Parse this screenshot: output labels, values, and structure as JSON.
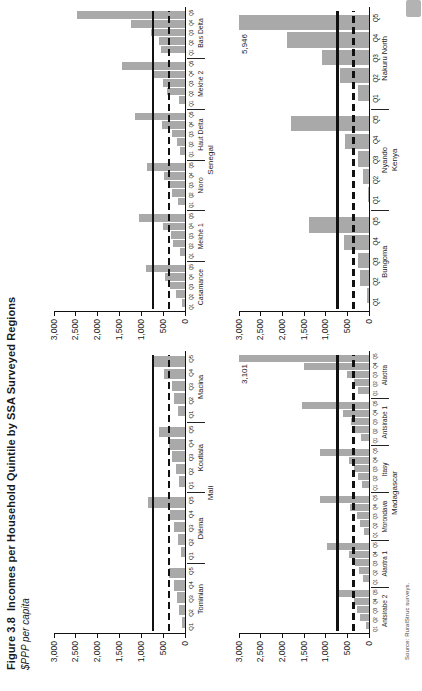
{
  "figure": {
    "label": "Figure 3.8",
    "title": "Incomes per Household Quintile by SSA Surveyed Regions",
    "subtitle": "$PPP per capita",
    "source": "Source: RuralStruc surveys.",
    "colors": {
      "bar": "#a9a9a9",
      "line": "#111111",
      "text": "#1a1a1a",
      "page_tab": "#b3b3b3"
    }
  },
  "chart_data": [
    {
      "type": "bar",
      "country": "Mali",
      "grid_position": "top-left",
      "ylim": [
        0,
        3000
      ],
      "yticks": [
        "0",
        "500",
        "1,000",
        "1,500",
        "2,000",
        "2,500",
        "3,000"
      ],
      "grid": false,
      "quintile_labels": [
        "Q1",
        "Q2",
        "Q3",
        "Q4",
        "Q5"
      ],
      "reference_lines": {
        "solid": 730,
        "dashed": 365
      },
      "groups": [
        {
          "region": "Tominian",
          "values": [
            60,
            130,
            190,
            245,
            370
          ]
        },
        {
          "region": "Diéma",
          "values": [
            90,
            170,
            260,
            340,
            850
          ]
        },
        {
          "region": "Koutiala",
          "values": [
            140,
            215,
            290,
            370,
            600
          ]
        },
        {
          "region": "Macina",
          "values": [
            170,
            245,
            305,
            475,
            740
          ]
        }
      ]
    },
    {
      "type": "bar",
      "country": "Senegal",
      "grid_position": "top-right",
      "ylim": [
        0,
        3000
      ],
      "yticks": [
        "0",
        "500",
        "1,000",
        "1,500",
        "2,000",
        "2,500",
        "3,000"
      ],
      "grid": false,
      "quintile_labels": [
        "Q1",
        "Q2",
        "Q3",
        "Q4",
        "Q5"
      ],
      "reference_lines": {
        "solid": 730,
        "dashed": 365
      },
      "groups": [
        {
          "region": "Casamance",
          "values": [
            60,
            210,
            345,
            460,
            900
          ]
        },
        {
          "region": "Mekhé 1",
          "values": [
            115,
            265,
            330,
            510,
            1060
          ]
        },
        {
          "region": "Nioro",
          "values": [
            150,
            290,
            380,
            485,
            870
          ]
        },
        {
          "region": "Haut Delta",
          "values": [
            105,
            180,
            310,
            530,
            1150
          ]
        },
        {
          "region": "Mekhé 2",
          "values": [
            140,
            420,
            500,
            700,
            1440
          ]
        },
        {
          "region": "Bas Delta",
          "values": [
            545,
            590,
            780,
            1230,
            2470
          ]
        }
      ]
    },
    {
      "type": "bar",
      "country": "Madagascar",
      "grid_position": "bottom-left",
      "ylim": [
        0,
        3000
      ],
      "yticks": [
        "0",
        "500",
        "1,000",
        "1,500",
        "2,000",
        "2,500",
        "3,000"
      ],
      "grid": false,
      "quintile_labels": [
        "Q1",
        "Q2",
        "Q3",
        "Q4",
        "Q5"
      ],
      "reference_lines": {
        "solid": 730,
        "dashed": 365
      },
      "annotation": {
        "text": "3,101",
        "value": 3101,
        "region": "Alaotra",
        "quintile": "Q5"
      },
      "groups": [
        {
          "region": "Antsirabe 2",
          "values": [
            75,
            210,
            285,
            345,
            715
          ]
        },
        {
          "region": "Alaotra 1",
          "values": [
            130,
            225,
            315,
            470,
            980
          ]
        },
        {
          "region": "Morondava",
          "values": [
            115,
            215,
            285,
            440,
            1130
          ]
        },
        {
          "region": "Itasy",
          "values": [
            170,
            255,
            340,
            470,
            1130
          ]
        },
        {
          "region": "Antsirabe 1",
          "values": [
            195,
            315,
            410,
            590,
            1550
          ]
        },
        {
          "region": "Alaotra",
          "values": [
            255,
            345,
            500,
            1490,
            3101
          ]
        }
      ]
    },
    {
      "type": "bar",
      "country": "Kenya",
      "grid_position": "bottom-right",
      "ylim": [
        0,
        3000
      ],
      "yticks": [
        "0",
        "500",
        "1,000",
        "1,500",
        "2,000",
        "2,500",
        "3,000"
      ],
      "grid": false,
      "quintile_labels": [
        "Q1",
        "Q2",
        "Q3",
        "Q4",
        "Q5"
      ],
      "reference_lines": {
        "solid": 730,
        "dashed": 365
      },
      "annotation": {
        "text": "5,946",
        "value": 5946,
        "region": "Nakuru North",
        "quintile": "Q5"
      },
      "groups": [
        {
          "region": "Bungoma",
          "values": [
            50,
            215,
            265,
            570,
            1390
          ]
        },
        {
          "region": "Nyando",
          "values": [
            30,
            130,
            250,
            555,
            1800
          ]
        },
        {
          "region": "Nakuru North",
          "values": [
            265,
            660,
            1085,
            1900,
            5946
          ]
        }
      ]
    }
  ]
}
